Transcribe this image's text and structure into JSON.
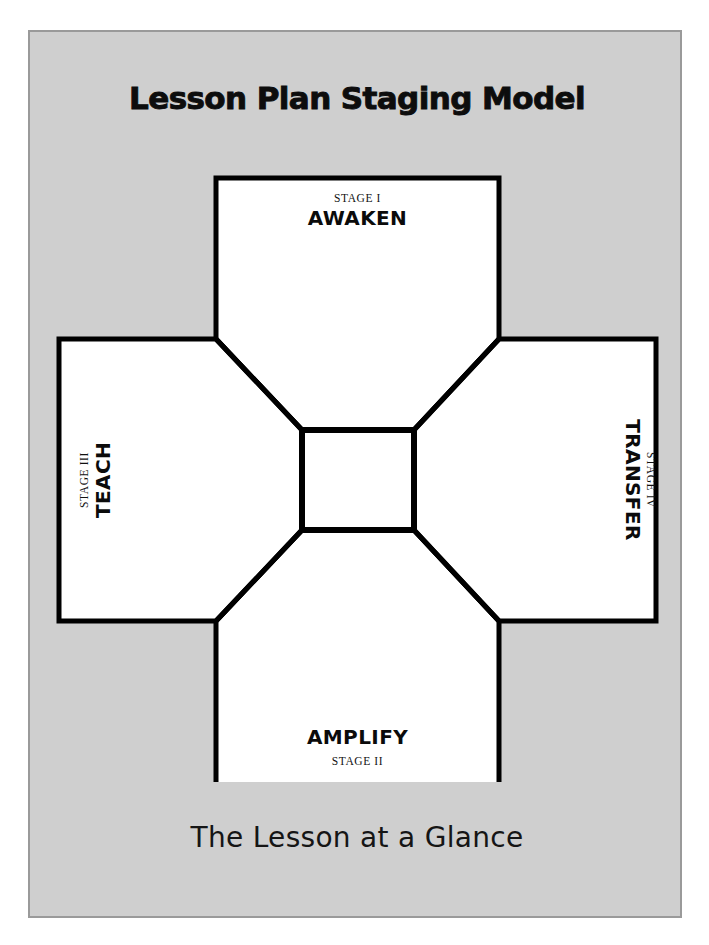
{
  "poster": {
    "title": "Lesson Plan Staging Model",
    "caption": "The Lesson at a Glance",
    "background_color": "#cfcfcf",
    "frame_color": "#9a9a9a",
    "ink_color": "#000000",
    "box_fill": "#ffffff"
  },
  "diagram": {
    "type": "cross-staging-model",
    "center": {
      "label": "",
      "shape": "square",
      "fill": "#ffffff"
    },
    "stages": {
      "top": {
        "stage_label": "STAGE I",
        "stage_name": "AWAKEN",
        "label_first": true,
        "orientation": "horizontal",
        "position": "top"
      },
      "bottom": {
        "stage_label": "STAGE II",
        "stage_name": "AMPLIFY",
        "label_first": false,
        "orientation": "horizontal",
        "position": "bottom"
      },
      "left": {
        "stage_label": "STAGE III",
        "stage_name": "TEACH",
        "label_first": true,
        "orientation": "rotated-ccw",
        "position": "left"
      },
      "right": {
        "stage_label": "STAGE IV",
        "stage_name": "TRANSFER",
        "label_first": false,
        "orientation": "rotated-cw",
        "position": "right"
      }
    }
  }
}
